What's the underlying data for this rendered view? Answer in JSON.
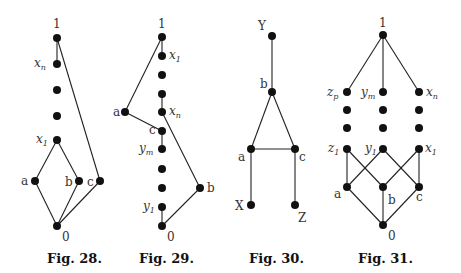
{
  "figures": [
    {
      "caption": "Fig. 28.",
      "nodes": [
        {
          "id": "1",
          "label": "1",
          "x": 57,
          "y": 38
        },
        {
          "id": "xn",
          "label": "x",
          "sub": "n",
          "x": 57,
          "y": 64
        },
        {
          "id": "d1",
          "label": "",
          "x": 57,
          "y": 90
        },
        {
          "id": "d2",
          "label": "",
          "x": 57,
          "y": 116
        },
        {
          "id": "x1",
          "label": "x",
          "sub": "1",
          "x": 57,
          "y": 140
        },
        {
          "id": "a",
          "label": "a",
          "x": 35,
          "y": 181
        },
        {
          "id": "b",
          "label": "b",
          "x": 79,
          "y": 181
        },
        {
          "id": "c",
          "label": "c",
          "x": 100,
          "y": 181
        },
        {
          "id": "0",
          "label": "0",
          "x": 57,
          "y": 226
        }
      ],
      "edges": [
        [
          "1",
          "xn"
        ],
        [
          "1",
          "c"
        ],
        [
          "x1",
          "a"
        ],
        [
          "x1",
          "b"
        ],
        [
          "a",
          "0"
        ],
        [
          "b",
          "0"
        ],
        [
          "c",
          "0"
        ]
      ]
    },
    {
      "caption": "Fig. 29.",
      "nodes": [
        {
          "id": "1",
          "label": "1",
          "x": 162,
          "y": 37
        },
        {
          "id": "x1",
          "label": "x",
          "sub": "1",
          "x": 162,
          "y": 56
        },
        {
          "id": "d1",
          "label": "",
          "x": 162,
          "y": 75
        },
        {
          "id": "d2",
          "label": "",
          "x": 162,
          "y": 94
        },
        {
          "id": "xn",
          "label": "x",
          "sub": "n",
          "x": 162,
          "y": 112
        },
        {
          "id": "a",
          "label": "a",
          "x": 125,
          "y": 112
        },
        {
          "id": "c",
          "label": "c",
          "x": 162,
          "y": 131
        },
        {
          "id": "ym",
          "label": "y",
          "sub": "m",
          "x": 162,
          "y": 149
        },
        {
          "id": "d3",
          "label": "",
          "x": 162,
          "y": 169
        },
        {
          "id": "d4",
          "label": "",
          "x": 162,
          "y": 188
        },
        {
          "id": "y1",
          "label": "y",
          "sub": "1",
          "x": 162,
          "y": 207
        },
        {
          "id": "b",
          "label": "b",
          "x": 200,
          "y": 188
        },
        {
          "id": "0",
          "label": "0",
          "x": 162,
          "y": 226
        }
      ],
      "edges": [
        [
          "1",
          "a"
        ],
        [
          "a",
          "c"
        ],
        [
          "c",
          "ym"
        ],
        [
          "xn",
          "b"
        ],
        [
          "b",
          "0"
        ],
        [
          "y1",
          "0"
        ]
      ]
    },
    {
      "caption": "Fig. 30.",
      "nodes": [
        {
          "id": "Y",
          "label": "Y",
          "x": 272,
          "y": 36
        },
        {
          "id": "b",
          "label": "b",
          "x": 272,
          "y": 92
        },
        {
          "id": "a",
          "label": "a",
          "x": 251,
          "y": 149
        },
        {
          "id": "c",
          "label": "c",
          "x": 295,
          "y": 149
        },
        {
          "id": "X",
          "label": "X",
          "x": 251,
          "y": 205
        },
        {
          "id": "Z",
          "label": "Z",
          "x": 295,
          "y": 205
        }
      ],
      "edges": [
        [
          "Y",
          "b"
        ],
        [
          "b",
          "a"
        ],
        [
          "b",
          "c"
        ],
        [
          "a",
          "c"
        ],
        [
          "a",
          "X"
        ],
        [
          "c",
          "Z"
        ]
      ]
    },
    {
      "caption": "Fig. 31.",
      "nodes": [
        {
          "id": "1",
          "label": "1",
          "x": 383,
          "y": 35
        },
        {
          "id": "zp",
          "label": "z",
          "sub": "p",
          "x": 347,
          "y": 92
        },
        {
          "id": "ym",
          "label": "y",
          "sub": "m",
          "x": 383,
          "y": 92
        },
        {
          "id": "xn",
          "label": "x",
          "sub": "n",
          "x": 419,
          "y": 92
        },
        {
          "id": "dz1",
          "label": "",
          "x": 347,
          "y": 110
        },
        {
          "id": "dy1",
          "label": "",
          "x": 383,
          "y": 110
        },
        {
          "id": "dx1",
          "label": "",
          "x": 419,
          "y": 110
        },
        {
          "id": "dz2",
          "label": "",
          "x": 347,
          "y": 128
        },
        {
          "id": "dy2",
          "label": "",
          "x": 383,
          "y": 128
        },
        {
          "id": "dx2",
          "label": "",
          "x": 419,
          "y": 128
        },
        {
          "id": "z1",
          "label": "z",
          "sub": "1",
          "x": 347,
          "y": 149
        },
        {
          "id": "y1",
          "label": "y",
          "sub": "1",
          "x": 383,
          "y": 149
        },
        {
          "id": "x1",
          "label": "x",
          "sub": "1",
          "x": 419,
          "y": 149
        },
        {
          "id": "a",
          "label": "a",
          "x": 347,
          "y": 187
        },
        {
          "id": "b",
          "label": "b",
          "x": 383,
          "y": 187
        },
        {
          "id": "c",
          "label": "c",
          "x": 419,
          "y": 187
        },
        {
          "id": "0",
          "label": "0",
          "x": 383,
          "y": 225
        }
      ],
      "edges": [
        [
          "1",
          "zp"
        ],
        [
          "1",
          "ym"
        ],
        [
          "1",
          "xn"
        ],
        [
          "z1",
          "a"
        ],
        [
          "z1",
          "b"
        ],
        [
          "y1",
          "a"
        ],
        [
          "y1",
          "c"
        ],
        [
          "x1",
          "b"
        ],
        [
          "x1",
          "c"
        ],
        [
          "a",
          "0"
        ],
        [
          "b",
          "0"
        ],
        [
          "c",
          "0"
        ]
      ]
    }
  ]
}
